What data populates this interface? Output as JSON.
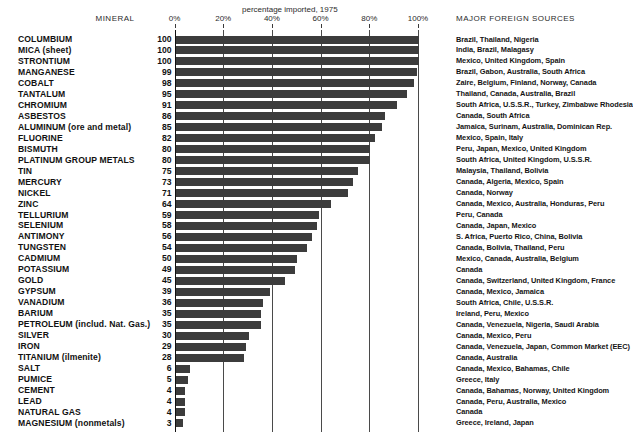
{
  "header": {
    "mineral_column": "MINERAL",
    "axis_title": "percentage imported, 1975",
    "sources_column": "MAJOR FOREIGN SOURCES"
  },
  "axis": {
    "ticks": [
      "0%",
      "20%",
      "40%",
      "60%",
      "80%",
      "100%"
    ],
    "tick_values": [
      0,
      20,
      40,
      60,
      80,
      100
    ]
  },
  "chart_data": {
    "type": "bar",
    "orientation": "horizontal",
    "title": "percentage imported, 1975",
    "xlabel": "percentage imported, 1975",
    "ylabel": "MINERAL",
    "xlim": [
      0,
      100
    ],
    "grid": true,
    "legend": "none",
    "categories": [
      "COLUMBIUM",
      "MICA (sheet)",
      "STRONTIUM",
      "MANGANESE",
      "COBALT",
      "TANTALUM",
      "CHROMIUM",
      "ASBESTOS",
      "ALUMINUM (ore and metal)",
      "FLUORINE",
      "BISMUTH",
      "PLATINUM GROUP METALS",
      "TIN",
      "MERCURY",
      "NICKEL",
      "ZINC",
      "TELLURIUM",
      "SELENIUM",
      "ANTIMONY",
      "TUNGSTEN",
      "CADMIUM",
      "POTASSIUM",
      "GOLD",
      "GYPSUM",
      "VANADIUM",
      "BARIUM",
      "PETROLEUM (includ. Nat. Gas.)",
      "SILVER",
      "IRON",
      "TITANIUM (ilmenite)",
      "SALT",
      "PUMICE",
      "CEMENT",
      "LEAD",
      "NATURAL GAS",
      "MAGNESIUM (nonmetals)"
    ],
    "values": [
      100,
      100,
      100,
      99,
      98,
      95,
      91,
      86,
      85,
      82,
      80,
      80,
      75,
      73,
      71,
      64,
      59,
      58,
      56,
      54,
      50,
      49,
      45,
      39,
      36,
      35,
      35,
      30,
      29,
      28,
      6,
      5,
      4,
      4,
      4,
      3
    ],
    "sources": [
      "Brazil, Thailand, Nigeria",
      "India, Brazil,  Malagasy",
      "Mexico, United Kingdom, Spain",
      "Brazil, Gabon, Australia, South Africa",
      "Zaire, Belgium, Finland, Norway, Canada",
      "Thailand, Canada, Australia, Brazil",
      "South Africa, U.S.S.R., Turkey, Zimbabwe Rhodesia",
      "Canada, South Africa",
      "Jamaica, Surinam, Australia, Dominican Rep.",
      "Mexico, Spain, Italy",
      "Peru, Japan, Mexico, United Kingdom",
      "South Africa, United Kingdom, U.S.S.R.",
      "Malaysia, Thailand, Bolivia",
      "Canada, Algeria, Mexico, Spain",
      "Canada, Norway",
      "Canada, Mexico, Australia, Honduras, Peru",
      "Peru, Canada",
      "Canada, Japan, Mexico",
      "S. Africa, Puerto Rico, China, Bolivia",
      "Canada, Bolivia, Thailand, Peru",
      "Mexico, Canada, Australia, Belgium",
      "Canada",
      "Canada, Switzerland, United Kingdom, France",
      "Canada, Mexico, Jamaica",
      "South Africa, Chile, U.S.S.R.",
      "Ireland, Peru, Mexico",
      "Canada, Venezuela, Nigeria, Saudi Arabia",
      "Canada, Mexico, Peru",
      "Canada, Venezuela, Japan, Common Market (EEC)",
      "Canada, Australia",
      "Canada, Mexico, Bahamas, Chile",
      "Greece, Italy",
      "Canada, Bahamas, Norway, United Kingdom",
      "Canada, Peru, Australia, Mexico",
      "Canada",
      "Greece, Ireland, Japan"
    ]
  },
  "colors": {
    "bar": "#3c3c3c",
    "axis": "#111111",
    "grid": "#4a4a4a",
    "background": "#ffffff",
    "text": "#111111"
  }
}
